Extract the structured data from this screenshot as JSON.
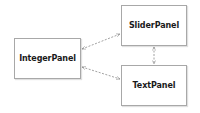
{
  "diagram": {
    "nodes": [
      {
        "id": "integer",
        "label": "IntegerPanel",
        "x": 14,
        "y": 38,
        "w": 67,
        "h": 41
      },
      {
        "id": "slider",
        "label": "SliderPanel",
        "x": 121,
        "y": 5,
        "w": 66,
        "h": 41
      },
      {
        "id": "text",
        "label": "TextPanel",
        "x": 121,
        "y": 65,
        "w": 66,
        "h": 41
      }
    ],
    "edges": [
      {
        "from": "integer",
        "to": "slider",
        "style": "dashed",
        "arrows": "both"
      },
      {
        "from": "integer",
        "to": "text",
        "style": "dashed",
        "arrows": "both"
      },
      {
        "from": "slider",
        "to": "text",
        "style": "dashed",
        "arrows": "both"
      }
    ],
    "colors": {
      "border": "#a8a8a8",
      "edge": "#8a8a8a",
      "text": "#1a1a1a"
    }
  }
}
